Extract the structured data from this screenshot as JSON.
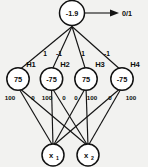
{
  "diagram": {
    "type": "feedforward-neural-network",
    "colors": {
      "background": "#f2f2f0",
      "stroke": "#111111",
      "node_fill": "#ffffff",
      "text": "#0d0d0d"
    },
    "output_node": {
      "name": "output-unit",
      "threshold": "-1.9"
    },
    "output_signal": {
      "label": "0/1"
    },
    "hidden_nodes": [
      {
        "name": "H1",
        "label": "H1",
        "threshold": "75"
      },
      {
        "name": "H2",
        "label": "H2",
        "threshold": "-75"
      },
      {
        "name": "H3",
        "label": "H3",
        "threshold": "75"
      },
      {
        "name": "H4",
        "label": "H4",
        "threshold": "-75"
      }
    ],
    "input_nodes": [
      {
        "name": "x1",
        "base": "x",
        "sub": "1"
      },
      {
        "name": "x2",
        "base": "x",
        "sub": "2"
      }
    ],
    "output_weights": [
      {
        "from": "output-unit",
        "to": "H1",
        "value": "1"
      },
      {
        "from": "output-unit",
        "to": "H2",
        "value": "-1"
      },
      {
        "from": "output-unit",
        "to": "H3",
        "value": "1"
      },
      {
        "from": "output-unit",
        "to": "H4",
        "value": "-1"
      }
    ],
    "input_weights": [
      {
        "from": "H1",
        "to": "x1",
        "value": "100"
      },
      {
        "from": "H1",
        "to": "x2",
        "value": "0"
      },
      {
        "from": "H2",
        "to": "x1",
        "value": "100"
      },
      {
        "from": "H2",
        "to": "x2",
        "value": "0"
      },
      {
        "from": "H3",
        "to": "x1",
        "value": "0"
      },
      {
        "from": "H3",
        "to": "x2",
        "value": "100"
      },
      {
        "from": "H4",
        "to": "x1",
        "value": "0"
      },
      {
        "from": "H4",
        "to": "x2",
        "value": "100"
      }
    ]
  }
}
